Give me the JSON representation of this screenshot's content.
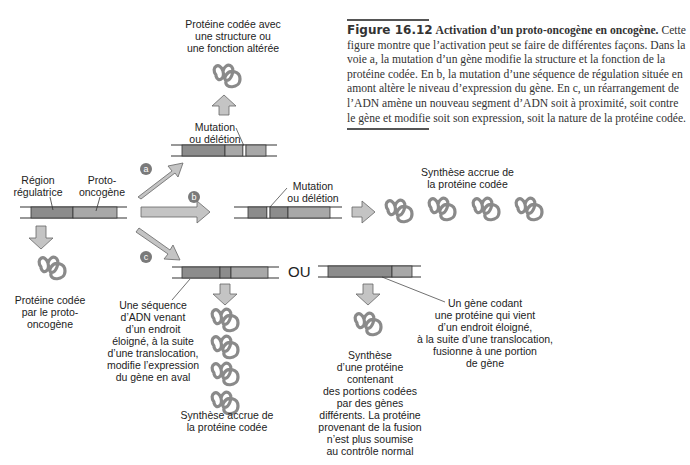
{
  "caption": {
    "figure_number": "Figure 16.12",
    "title": "Activation d’un proto-oncogène en oncogène.",
    "body": "Cette figure montre que l’activation peut se faire de différentes façons. Dans la voie a, la mutation d’un gène modifie la structure et la fonction de la protéine codée. En b, la mutation d’une séquence de régulation située en amont altère le niveau d’expression du gène. En c, un réarrangement de l’ADN amène un nouveau segment d’ADN soit à proximité, soit contre le gène et modifie soit son expression, soit la nature de la protéine codée."
  },
  "original_gene": {
    "label_region": "Région\nrégulatrice",
    "label_gene": "Proto-\noncogène",
    "protein_label": "Protéine codée\npar le proto-\noncogène"
  },
  "pathways": {
    "a": {
      "badge": "a",
      "mutation_label": "Mutation\nou délétion",
      "result_label": "Protéine codée avec\nune structure ou\nune fonction altérée"
    },
    "b": {
      "badge": "b",
      "mutation_label": "Mutation\nou délétion",
      "result_label": "Synthèse accrue de\nla protéine codée"
    },
    "c": {
      "badge": "c",
      "or_label": "OU",
      "left_annotation": "Une séquence\nd’ADN venant\nd’un endroit\néloigné, à la suite\nd’une translocation,\nmodifie l’expression\ndu gène en aval",
      "left_result": "Synthèse accrue de\nla protéine codée",
      "right_annotation": "Un gène codant\nune protéine qui vient\nd’un endroit éloigné,\nà la suite d’une translocation,\nfusionne à une portion\nde gène",
      "right_result": "Synthèse\nd’une protéine\ncontenant\ndes portions codées\npar des gènes\ndifférents. La protéine\nprovenant de la fusion\nn’est plus soumise\nau contrôle normal"
    }
  },
  "colors": {
    "dna_dark": "#8c8c8c",
    "dna_light": "#a8a8a8",
    "arrow_fill": "#c4c4c4",
    "badge": "#7a7a7a",
    "protein": "#8a8a8a"
  }
}
